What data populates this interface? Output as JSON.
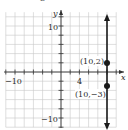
{
  "chart_data": {
    "type": "line",
    "title": "",
    "xlabel": "x",
    "ylabel": "y",
    "xlim": [
      -12,
      12
    ],
    "ylim": [
      -12,
      13
    ],
    "grid": true,
    "grid_step": 2,
    "x_tick_labels": [
      {
        "value": -10,
        "label": "−10"
      },
      {
        "value": 4,
        "label": "4"
      }
    ],
    "y_tick_labels": [
      {
        "value": 10,
        "label": "10"
      },
      {
        "value": -10,
        "label": "−10"
      }
    ],
    "series": [
      {
        "name": "x = 10",
        "kind": "vertical-line",
        "x": 10,
        "arrows": "both",
        "color": "#1a1a1a"
      }
    ],
    "points": [
      {
        "x": 10,
        "y": 2,
        "label": "(10,2)"
      },
      {
        "x": 10,
        "y": -3,
        "label": "(10,−3)"
      }
    ],
    "colors": {
      "grid": "#c8c8c8",
      "axes": "#333333",
      "line": "#1a1a1a",
      "points": "#1a1a1a"
    }
  },
  "labels": {
    "x_axis": "x",
    "y_axis": "y",
    "x_tick_neg10": "−10",
    "x_tick_4": "4",
    "y_tick_10": "10",
    "y_tick_neg10": "−10",
    "point_a": "(10,2)",
    "point_b": "(10,−3)",
    "top_cut": "2"
  }
}
